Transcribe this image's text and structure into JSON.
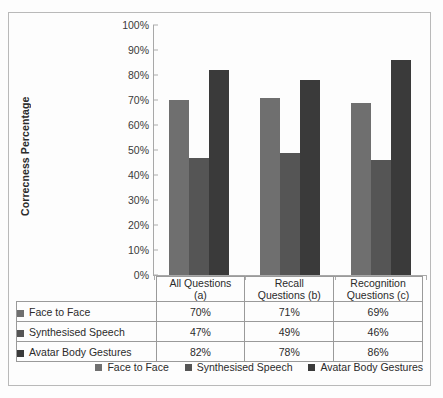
{
  "chart_data": {
    "type": "bar",
    "title": "",
    "xlabel": "",
    "ylabel": "Correcness Percentage",
    "ylim": [
      0,
      100
    ],
    "ytick_labels": [
      "100%",
      "90%",
      "80%",
      "70%",
      "60%",
      "50%",
      "40%",
      "30%",
      "20%",
      "10%",
      "0%"
    ],
    "ytick_values": [
      100,
      90,
      80,
      70,
      60,
      50,
      40,
      30,
      20,
      10,
      0
    ],
    "grid": false,
    "legend_position": "bottom-right",
    "categories": [
      "All Questions (a)",
      "Recall Questions (b)",
      "Recognition Questions (c)"
    ],
    "category_lines": [
      [
        "All Questions",
        "(a)"
      ],
      [
        "Recall",
        "Questions (b)"
      ],
      [
        "Recognition",
        "Questions (c)"
      ]
    ],
    "series": [
      {
        "name": "Face to Face",
        "color": "#6f6f6f",
        "values": [
          70,
          71,
          69
        ],
        "labels": [
          "70%",
          "71%",
          "69%"
        ]
      },
      {
        "name": "Synthesised Speech",
        "color": "#555555",
        "values": [
          47,
          49,
          46
        ],
        "labels": [
          "47%",
          "49%",
          "46%"
        ]
      },
      {
        "name": "Avatar Body Gestures",
        "color": "#3a3a3a",
        "values": [
          82,
          78,
          86
        ],
        "labels": [
          "82%",
          "78%",
          "86%"
        ]
      }
    ]
  },
  "table": {
    "header_row": [
      "",
      "All Questions (a)",
      "Recall Questions (b)",
      "Recognition Questions (c)"
    ],
    "rows": [
      {
        "label": "Face to Face",
        "color": "#6f6f6f",
        "values": [
          "70%",
          "71%",
          "69%"
        ]
      },
      {
        "label": "Synthesised Speech",
        "color": "#555555",
        "values": [
          "47%",
          "49%",
          "46%"
        ]
      },
      {
        "label": "Avatar Body Gestures",
        "color": "#3a3a3a",
        "values": [
          "82%",
          "78%",
          "86%"
        ]
      }
    ]
  },
  "legend": {
    "items": [
      {
        "label": "Face to Face",
        "color": "#6f6f6f"
      },
      {
        "label": "Synthesised Speech",
        "color": "#555555"
      },
      {
        "label": "Avatar Body Gestures",
        "color": "#3a3a3a"
      }
    ]
  }
}
